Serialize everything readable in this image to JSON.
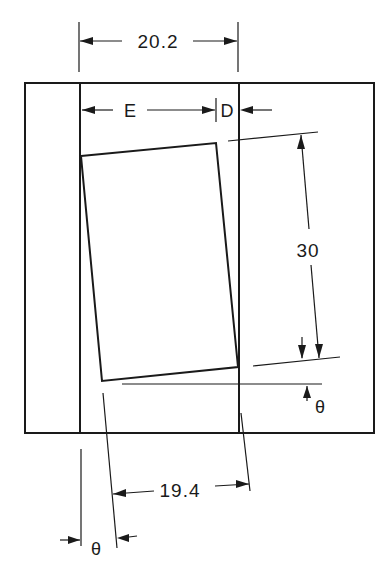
{
  "diagram": {
    "type": "engineering-dimension-drawing",
    "colors": {
      "line": "#1a1a1a",
      "background": "#ffffff"
    },
    "dimensions": {
      "top_width": "20.2",
      "left_gap": "E",
      "right_gap": "D",
      "block_height": "30",
      "block_width": "19.4",
      "tilt_angle_right": "θ",
      "tilt_angle_bottom": "θ"
    }
  }
}
